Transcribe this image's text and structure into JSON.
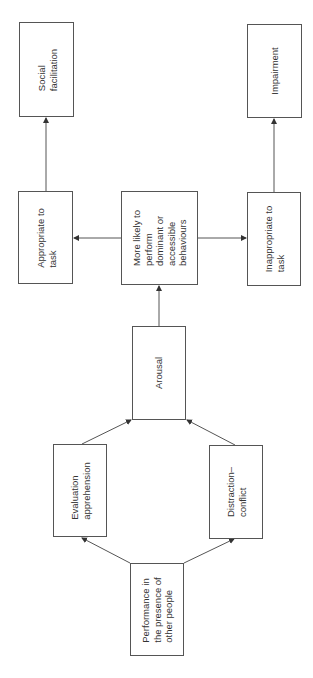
{
  "diagram": {
    "orientation": "rotated-90-ccw",
    "nodes": [
      {
        "id": "social_facilitation",
        "label": "Social\nfacilitation"
      },
      {
        "id": "impairment",
        "label": "Impairment"
      },
      {
        "id": "appropriate",
        "label": "Appropriate to\ntask"
      },
      {
        "id": "dominant",
        "label": "More likely to\nperform\ndominant or\naccessible\nbehaviours"
      },
      {
        "id": "inappropriate",
        "label": "Inappropriate to\ntask"
      },
      {
        "id": "arousal",
        "label": "Arousal"
      },
      {
        "id": "evaluation",
        "label": "Evaluation\napprehension"
      },
      {
        "id": "distraction",
        "label": "Distraction–\nconflict"
      },
      {
        "id": "presence",
        "label": "Performance in\nthe presence of\nother people"
      }
    ],
    "edges": [
      {
        "from": "presence",
        "to": "evaluation"
      },
      {
        "from": "presence",
        "to": "distraction"
      },
      {
        "from": "evaluation",
        "to": "arousal"
      },
      {
        "from": "distraction",
        "to": "arousal"
      },
      {
        "from": "arousal",
        "to": "dominant"
      },
      {
        "from": "dominant",
        "to": "appropriate"
      },
      {
        "from": "dominant",
        "to": "inappropriate"
      },
      {
        "from": "appropriate",
        "to": "social_facilitation"
      },
      {
        "from": "inappropriate",
        "to": "impairment"
      }
    ]
  }
}
